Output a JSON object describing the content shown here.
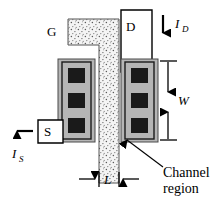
{
  "figure": {
    "background_color": "#ffffff",
    "stroke_color": "#000000",
    "diffusion_fill": "#b5b5b5",
    "contact_fill": "#1a1a1a",
    "gate_fill": "#f2f2f2",
    "terminal_fill": "#ffffff"
  },
  "labels": {
    "gate": "G",
    "drain": "D",
    "source": "S",
    "width_dim": "W",
    "length_dim": "L",
    "drain_current": "I",
    "drain_current_sub": "D",
    "source_current": "I",
    "source_current_sub": "S",
    "callout_line1": "Channel",
    "callout_line2": "region"
  },
  "contacts": {
    "left_count": 3,
    "right_count": 3
  }
}
